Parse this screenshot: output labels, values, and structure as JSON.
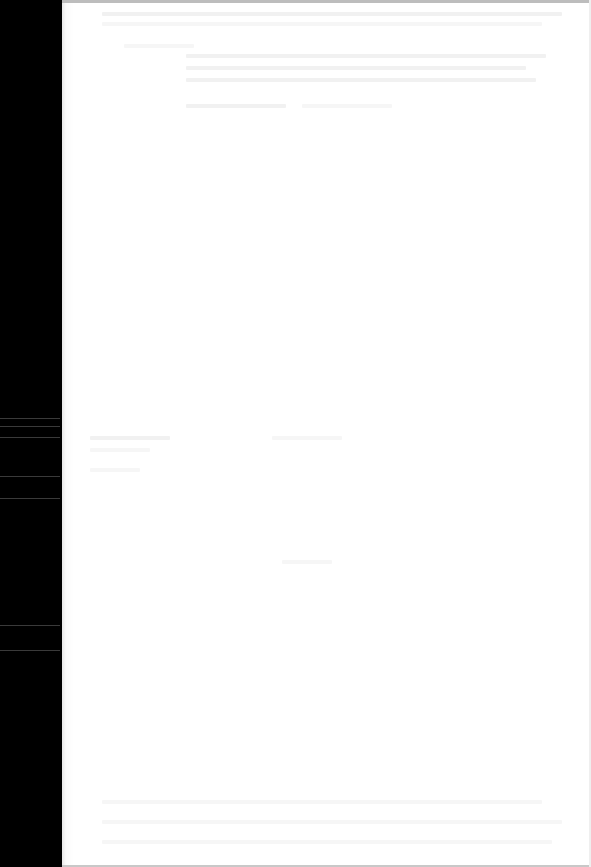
{
  "document": {
    "type": "scanned-page",
    "legible_text": "",
    "colors": {
      "page": "#ffffff",
      "margin_strip": "#000000",
      "ghost_text": "#f1f1f1"
    }
  }
}
